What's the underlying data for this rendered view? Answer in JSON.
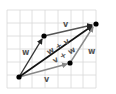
{
  "diagram": {
    "grid": {
      "x_lines": [
        7,
        20,
        32,
        45,
        58,
        71,
        83,
        96
      ],
      "y_lines": [
        10,
        23,
        36,
        49,
        62,
        75,
        88
      ],
      "color": "#d8d8d8"
    },
    "points": {
      "origin": [
        19,
        77
      ],
      "w_tip": [
        44,
        36
      ],
      "v_tip": [
        70,
        63
      ],
      "sum_tip": [
        96,
        24
      ]
    },
    "vectors": [
      {
        "id": "w1",
        "from": "origin",
        "to": "w_tip",
        "color": "#333333",
        "label": "w"
      },
      {
        "id": "v1",
        "from": "origin",
        "to": "v_tip",
        "color": "#8a8a8a",
        "label": "v"
      },
      {
        "id": "v2",
        "from": "w_tip",
        "to": "sum_tip",
        "color": "#555555",
        "label": "v"
      },
      {
        "id": "w2",
        "from": "v_tip",
        "to": "sum_tip",
        "color": "#8a8a8a",
        "label": "w"
      },
      {
        "id": "sum",
        "from": "origin",
        "to": "sum_tip",
        "color": "#111111",
        "label": "w + v"
      }
    ],
    "labels": {
      "w_left": "w",
      "v_top": "v",
      "v_bottom": "v",
      "w_right": "w",
      "sum_upper": "w + v",
      "sum_lower": "v + w"
    }
  }
}
